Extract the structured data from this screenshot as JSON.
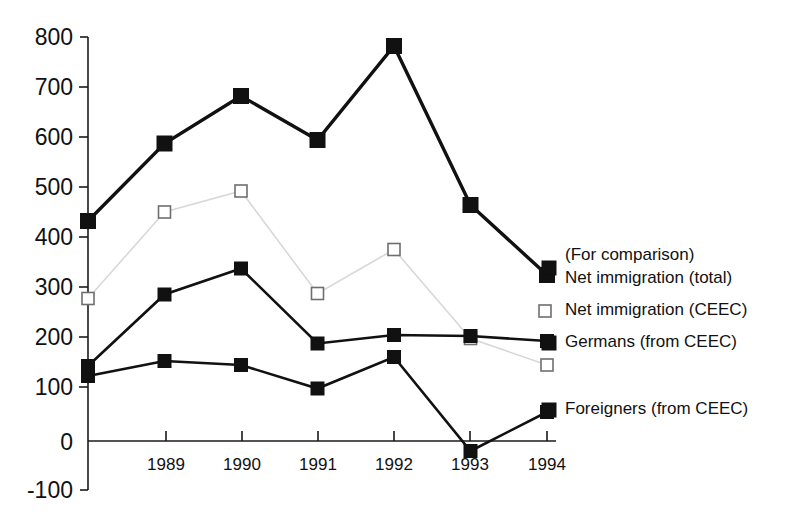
{
  "chart_data": {
    "type": "line",
    "title": "",
    "subtitle": "",
    "xlabel": "",
    "ylabel": "",
    "grid": false,
    "legend_position": "right",
    "x": [
      "1988",
      "1989",
      "1990",
      "1991",
      "1992",
      "1993",
      "1994"
    ],
    "xtick_labels": [
      "1989",
      "1990",
      "1991",
      "1992",
      "1993",
      "1994"
    ],
    "ytick_labels": [
      "800",
      "700",
      "600",
      "500",
      "400",
      "300",
      "200",
      "100",
      "0",
      "-100"
    ],
    "ytick_values": [
      800,
      700,
      600,
      500,
      400,
      300,
      200,
      100,
      0,
      -100
    ],
    "ylim": [
      -100,
      800
    ],
    "series": [
      {
        "name": "Net immigration (total)",
        "marker": "filled-square",
        "values": [
          440,
          595,
          690,
          602,
          790,
          472,
          332
        ]
      },
      {
        "name": "Net immigration (CEEC)",
        "marker": "open-square",
        "values": [
          285,
          458,
          500,
          295,
          383,
          205,
          152
        ]
      },
      {
        "name": "Germans (from CEEC)",
        "marker": "filled-square",
        "values": [
          150,
          293,
          345,
          195,
          212,
          210,
          200
        ]
      },
      {
        "name": "Foreigners (from CEEC)",
        "marker": "filled-square",
        "values": [
          130,
          160,
          152,
          105,
          168,
          -20,
          58
        ]
      }
    ],
    "annotations": [
      {
        "id": "comparison-note",
        "text": "(For comparison)"
      }
    ]
  },
  "legend": {
    "note": "(For comparison)",
    "entries": [
      {
        "label": "Net immigration (total)",
        "marker": "filled-square"
      },
      {
        "label": "Net immigration (CEEC)",
        "marker": "open-square"
      },
      {
        "label": "Germans (from CEEC)",
        "marker": "filled-square"
      },
      {
        "label": "Foreigners (from CEEC)",
        "marker": "filled-square"
      }
    ]
  },
  "colors": {
    "ink": "#111111",
    "faint_line": "#d8d8d8",
    "open_marker_stroke": "#6e6e6e",
    "background": "#ffffff"
  }
}
